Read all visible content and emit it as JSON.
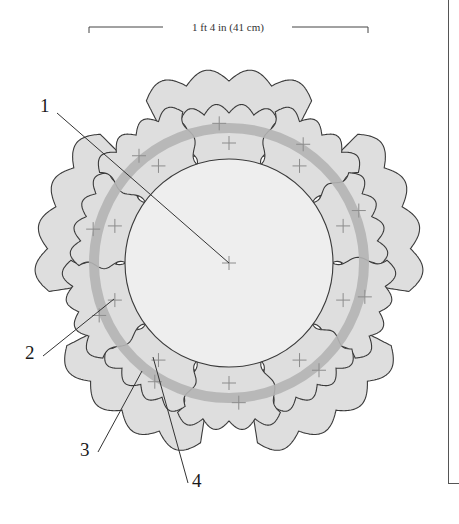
{
  "dimension": {
    "label": "1 ft 4 in (41 cm)"
  },
  "callouts": [
    {
      "id": "1",
      "label": "1"
    },
    {
      "id": "2",
      "label": "2"
    },
    {
      "id": "3",
      "label": "3"
    },
    {
      "id": "4",
      "label": "4"
    }
  ],
  "colors": {
    "outline": "#3a3a3a",
    "petal_fill": "#dedede",
    "inner_circle_fill": "#eeeeee",
    "ring_band": "#b4b4b4",
    "cross_mark": "#8c8c8c",
    "frame": "#555555"
  }
}
